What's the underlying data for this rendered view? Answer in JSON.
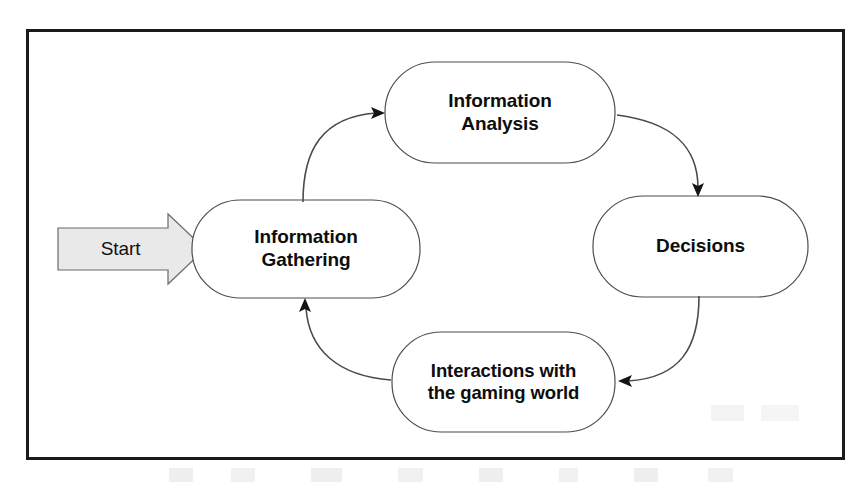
{
  "diagram": {
    "frame": {
      "border_color": "#1a1a1a",
      "background": "#ffffff"
    },
    "start": {
      "label": "Start",
      "shape": "block-arrow",
      "fill_color": "#e9e9e9",
      "stroke_color": "#6a6a6a"
    },
    "nodes": [
      {
        "id": "information-gathering",
        "label": "Information\nGathering",
        "shape": "rounded-rectangle",
        "fill_color": "#ffffff",
        "stroke_color": "#4d4d4d",
        "position": "left"
      },
      {
        "id": "information-analysis",
        "label": "Information\nAnalysis",
        "shape": "rounded-rectangle",
        "fill_color": "#ffffff",
        "stroke_color": "#4d4d4d",
        "position": "top"
      },
      {
        "id": "decisions",
        "label": "Decisions",
        "shape": "rounded-rectangle",
        "fill_color": "#ffffff",
        "stroke_color": "#4d4d4d",
        "position": "right"
      },
      {
        "id": "interactions-gaming-world",
        "label": "Interactions with\nthe gaming world",
        "shape": "rounded-rectangle",
        "fill_color": "#ffffff",
        "stroke_color": "#4d4d4d",
        "position": "bottom"
      }
    ],
    "connectors": [
      {
        "id": "start-to-gathering",
        "from": "start",
        "to": "information-gathering",
        "style": "block-arrow"
      },
      {
        "id": "gathering-to-analysis",
        "from": "information-gathering",
        "to": "information-analysis",
        "style": "curved-arrow"
      },
      {
        "id": "analysis-to-decisions",
        "from": "information-analysis",
        "to": "decisions",
        "style": "curved-arrow"
      },
      {
        "id": "decisions-to-interactions",
        "from": "decisions",
        "to": "interactions-gaming-world",
        "style": "curved-arrow"
      },
      {
        "id": "interactions-to-gathering",
        "from": "interactions-gaming-world",
        "to": "information-gathering",
        "style": "curved-arrow"
      }
    ]
  }
}
